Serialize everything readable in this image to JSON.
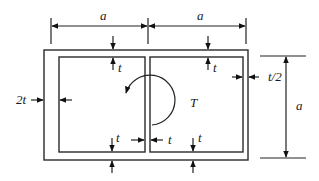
{
  "diagram": {
    "labels": {
      "width_left": "a",
      "width_right": "a",
      "height": "a",
      "top_left_thickness": "t",
      "top_right_thickness": "t",
      "bottom_left_thickness": "t",
      "bottom_right_thickness": "t",
      "web_thickness": "t",
      "left_wall_thickness": "2t",
      "right_wall_thickness": "t/2",
      "torque": "T"
    },
    "colors": {
      "line": "#222222",
      "background": "#ffffff"
    }
  }
}
